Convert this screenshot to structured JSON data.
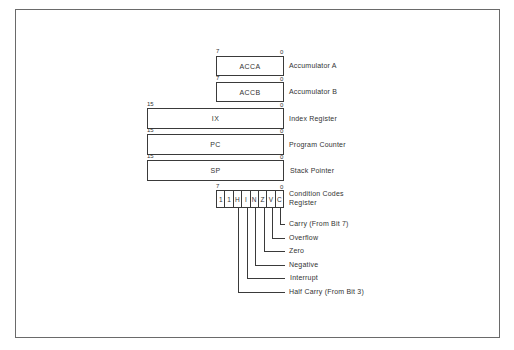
{
  "registers": [
    {
      "name": "ACCA",
      "description": "Accumulator A",
      "high_bit": "7",
      "low_bit": "0"
    },
    {
      "name": "ACCB",
      "description": "Accumulator B",
      "high_bit": "7",
      "low_bit": "0"
    },
    {
      "name": "IX",
      "description": "Index Register",
      "high_bit": "15",
      "low_bit": "0"
    },
    {
      "name": "PC",
      "description": "Program Counter",
      "high_bit": "15",
      "low_bit": "0"
    },
    {
      "name": "SP",
      "description": "Stack Pointer",
      "high_bit": "15",
      "low_bit": "0"
    }
  ],
  "ccr": {
    "description_line1": "Condition Codes",
    "description_line2": "Register",
    "high_bit": "7",
    "low_bit": "0",
    "bits": [
      "1",
      "1",
      "H",
      "I",
      "N",
      "Z",
      "V",
      "C"
    ],
    "flags": [
      {
        "bit": "C",
        "label": "Carry (From Bit 7)"
      },
      {
        "bit": "V",
        "label": "Overflow"
      },
      {
        "bit": "Z",
        "label": "Zero"
      },
      {
        "bit": "N",
        "label": "Negative"
      },
      {
        "bit": "I",
        "label": "Interrupt"
      },
      {
        "bit": "H",
        "label": "Half Carry (From Bit 3)"
      }
    ]
  }
}
